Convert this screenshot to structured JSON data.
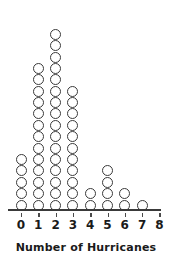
{
  "chart_data": {
    "type": "dotplot",
    "title": "",
    "xlabel": "Number of Hurricanes",
    "ylabel": "",
    "categories": [
      "0",
      "1",
      "2",
      "3",
      "4",
      "5",
      "6",
      "7",
      "8"
    ],
    "values": [
      5,
      13,
      16,
      11,
      2,
      4,
      2,
      1,
      0
    ],
    "tick_labels": [
      "0",
      "1",
      "2",
      "3",
      "4",
      "5",
      "6",
      "7",
      "8"
    ],
    "xlim": [
      0,
      8
    ],
    "ylim": [
      0,
      16
    ],
    "grid": false,
    "legend": null,
    "dot_style": "open-circle",
    "colors": {
      "dot_outline": "#3a3a3a",
      "dot_fill": "#ffffff",
      "axis": "#3a3a3a",
      "text": "#1a1a1a",
      "background": "#ffffff"
    },
    "annotations": []
  },
  "axis": {
    "title": "Number of Hurricanes"
  }
}
